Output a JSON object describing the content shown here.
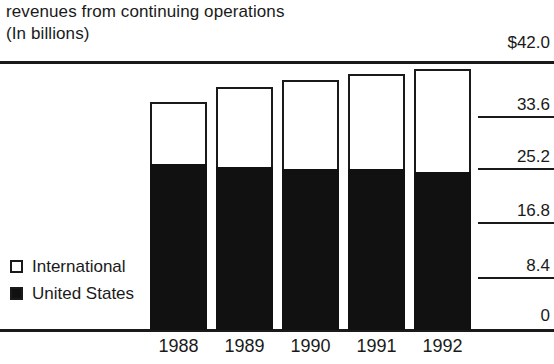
{
  "header": {
    "title_line1": "revenues from continuing operations",
    "title_line2": "(In billions)"
  },
  "legend": {
    "items": [
      {
        "label": "International",
        "swatch": "hollow-square-icon",
        "color": "#ffffff"
      },
      {
        "label": "United States",
        "swatch": "filled-square-icon",
        "color": "#111111"
      }
    ]
  },
  "axis": {
    "y_ticks": [
      "$42.0",
      "33.6",
      "25.2",
      "16.8",
      "8.4",
      "0"
    ],
    "x_ticks": [
      "1988",
      "1989",
      "1990",
      "1991",
      "1992"
    ]
  },
  "chart_data": {
    "type": "bar",
    "stacked": true,
    "title": "revenues from continuing operations",
    "subtitle": "(In billions)",
    "xlabel": "",
    "ylabel": "(In billions)",
    "ylim": [
      0,
      42.0
    ],
    "ytick_values": [
      0,
      8.4,
      16.8,
      25.2,
      33.6,
      42.0
    ],
    "ytick_labels": [
      "0",
      "8.4",
      "16.8",
      "25.2",
      "33.6",
      "$42.0"
    ],
    "grid": true,
    "legend_position": "inside-left-lower",
    "categories": [
      "1988",
      "1989",
      "1990",
      "1991",
      "1992"
    ],
    "series": [
      {
        "name": "United States",
        "color": "#111111",
        "values": [
          26.1,
          25.6,
          25.4,
          25.3,
          24.9
        ]
      },
      {
        "name": "International",
        "color": "#ffffff",
        "values": [
          9.7,
          12.7,
          13.9,
          14.9,
          16.2
        ]
      }
    ],
    "totals": [
      35.8,
      38.3,
      39.3,
      40.2,
      41.1
    ]
  },
  "geometry": {
    "y_zero_px": 269,
    "y_max_px": 2,
    "y_max_value": 42.0,
    "bar_left_px": [
      150,
      216,
      282,
      348,
      414
    ],
    "bar_width_px": 57,
    "ytick_label_tops": [
      33,
      86,
      139,
      192,
      245,
      299
    ],
    "ygrid_tops": [
      116,
      168,
      222,
      277
    ]
  }
}
